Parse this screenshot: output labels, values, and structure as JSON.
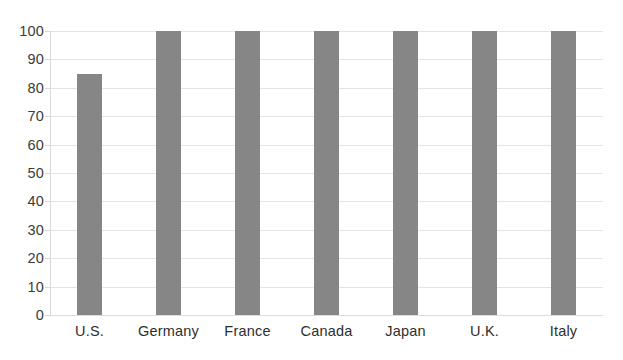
{
  "chart_data": {
    "type": "bar",
    "title": "",
    "subtitle": "",
    "xlabel": "",
    "ylabel": "",
    "categories": [
      "U.S.",
      "Germany",
      "France",
      "Canada",
      "Japan",
      "U.K.",
      "Italy"
    ],
    "values": [
      85,
      100,
      100,
      100,
      100,
      100,
      100
    ],
    "ylim": [
      0,
      100
    ],
    "yticks": [
      0,
      10,
      20,
      30,
      40,
      50,
      60,
      70,
      80,
      90,
      100
    ],
    "ytick_labels": [
      "0",
      "10",
      "20",
      "30",
      "40",
      "50",
      "60",
      "70",
      "80",
      "90",
      "100"
    ],
    "grid": true,
    "grid_axis": "y",
    "legend": false,
    "legend_position": "none",
    "annotations": [],
    "colors": {
      "bar": "#868686",
      "gridline": "#e4e4e4",
      "axis": "#d8d8d8",
      "tick_label": "#3b3b3b",
      "category_label": "#2e2e2e",
      "background": "#ffffff"
    }
  }
}
